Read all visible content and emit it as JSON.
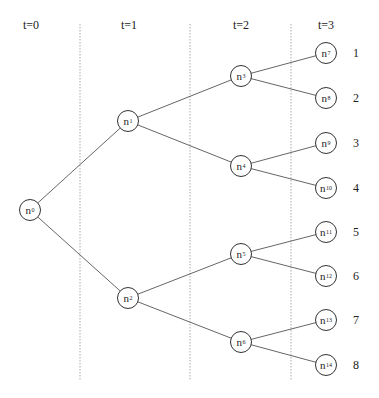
{
  "time_headers": [
    {
      "label": "t=0",
      "x": 31,
      "y": 18
    },
    {
      "label": "t=1",
      "x": 129,
      "y": 18
    },
    {
      "label": "t=2",
      "x": 241,
      "y": 18
    },
    {
      "label": "t=3",
      "x": 326,
      "y": 18
    }
  ],
  "separators": [
    {
      "x": 80,
      "y1": 24,
      "y2": 381
    },
    {
      "x": 190,
      "y1": 24,
      "y2": 381
    },
    {
      "x": 291,
      "y1": 24,
      "y2": 381
    }
  ],
  "nodes": [
    {
      "id": "n0",
      "base": "n",
      "sub": "0",
      "x": 30,
      "y": 210
    },
    {
      "id": "n1",
      "base": "n",
      "sub": "1",
      "x": 128,
      "y": 121
    },
    {
      "id": "n2",
      "base": "n",
      "sub": "2",
      "x": 128,
      "y": 298
    },
    {
      "id": "n3",
      "base": "n",
      "sub": "3",
      "x": 241,
      "y": 76
    },
    {
      "id": "n4",
      "base": "n",
      "sub": "4",
      "x": 241,
      "y": 166
    },
    {
      "id": "n5",
      "base": "n",
      "sub": "5",
      "x": 241,
      "y": 254
    },
    {
      "id": "n6",
      "base": "n",
      "sub": "6",
      "x": 241,
      "y": 342
    },
    {
      "id": "n7",
      "base": "n",
      "sub": "7",
      "x": 326,
      "y": 53
    },
    {
      "id": "n8",
      "base": "n",
      "sub": "8",
      "x": 326,
      "y": 98
    },
    {
      "id": "n9",
      "base": "n",
      "sub": "9",
      "x": 326,
      "y": 143
    },
    {
      "id": "n10",
      "base": "n",
      "sub": "10",
      "x": 326,
      "y": 188
    },
    {
      "id": "n11",
      "base": "n",
      "sub": "11",
      "x": 326,
      "y": 232
    },
    {
      "id": "n12",
      "base": "n",
      "sub": "12",
      "x": 326,
      "y": 276
    },
    {
      "id": "n13",
      "base": "n",
      "sub": "13",
      "x": 326,
      "y": 320
    },
    {
      "id": "n14",
      "base": "n",
      "sub": "14",
      "x": 326,
      "y": 365
    }
  ],
  "edges": [
    [
      "n0",
      "n1"
    ],
    [
      "n0",
      "n2"
    ],
    [
      "n1",
      "n3"
    ],
    [
      "n1",
      "n4"
    ],
    [
      "n2",
      "n5"
    ],
    [
      "n2",
      "n6"
    ],
    [
      "n3",
      "n7"
    ],
    [
      "n3",
      "n8"
    ],
    [
      "n4",
      "n9"
    ],
    [
      "n4",
      "n10"
    ],
    [
      "n5",
      "n11"
    ],
    [
      "n5",
      "n12"
    ],
    [
      "n6",
      "n13"
    ],
    [
      "n6",
      "n14"
    ]
  ],
  "scenario_labels": [
    {
      "label": "1",
      "x": 356,
      "y": 53
    },
    {
      "label": "2",
      "x": 356,
      "y": 98
    },
    {
      "label": "3",
      "x": 356,
      "y": 143
    },
    {
      "label": "4",
      "x": 356,
      "y": 188
    },
    {
      "label": "5",
      "x": 356,
      "y": 232
    },
    {
      "label": "6",
      "x": 356,
      "y": 276
    },
    {
      "label": "7",
      "x": 356,
      "y": 320
    },
    {
      "label": "8",
      "x": 356,
      "y": 365
    }
  ],
  "colors": {
    "edge": "#555555",
    "separator": "#aaaaaa",
    "node_border": "#333333"
  }
}
